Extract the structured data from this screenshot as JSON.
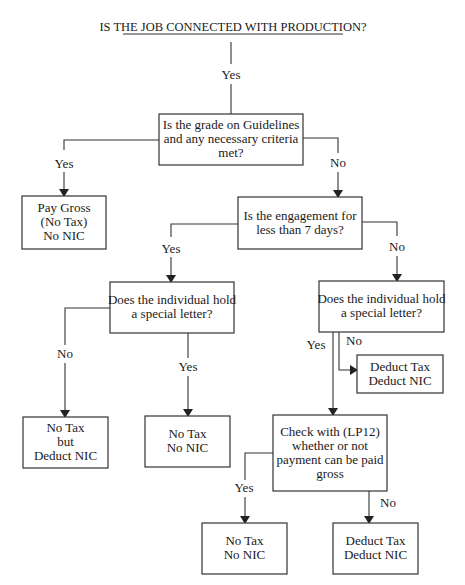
{
  "title": "IS THE JOB CONNECTED WITH PRODUCTION?",
  "colors": {
    "line": "#333333",
    "text": "#1a1a1a",
    "background": "#ffffff"
  },
  "nodes": {
    "q_guidelines": {
      "lines": [
        "Is the grade on Guidelines",
        "and any necessary criteria",
        "met?"
      ]
    },
    "r_pay_gross": {
      "lines": [
        "Pay Gross",
        "(No Tax)",
        "No NIC"
      ]
    },
    "q_engagement": {
      "lines": [
        "Is the engagement for",
        "less than 7 days?"
      ]
    },
    "q_letter_left": {
      "lines": [
        "Does the individual hold",
        "a special letter?"
      ]
    },
    "q_letter_right": {
      "lines": [
        "Does the individual hold",
        "a special letter?"
      ]
    },
    "r_deduct_top": {
      "lines": [
        "Deduct Tax",
        "Deduct NIC"
      ]
    },
    "r_notax_but": {
      "lines": [
        "No Tax",
        "but",
        "Deduct NIC"
      ]
    },
    "r_notax_nonic_mid": {
      "lines": [
        "No Tax",
        "No NIC"
      ]
    },
    "q_check_lp12": {
      "lines": [
        "Check with (LP12)",
        "whether or not",
        "payment can be paid",
        "gross"
      ]
    },
    "r_notax_nonic_bottom": {
      "lines": [
        "No Tax",
        "No NIC"
      ]
    },
    "r_deduct_bottom": {
      "lines": [
        "Deduct Tax",
        "Deduct NIC"
      ]
    }
  },
  "edge_labels": {
    "start_yes": "Yes",
    "guidelines_yes": "Yes",
    "guidelines_no": "No",
    "engagement_yes": "Yes",
    "engagement_no": "No",
    "letter_left_no": "No",
    "letter_left_yes": "Yes",
    "letter_right_yes": "Yes",
    "letter_right_no": "No",
    "check_yes": "Yes",
    "check_no": "No"
  }
}
